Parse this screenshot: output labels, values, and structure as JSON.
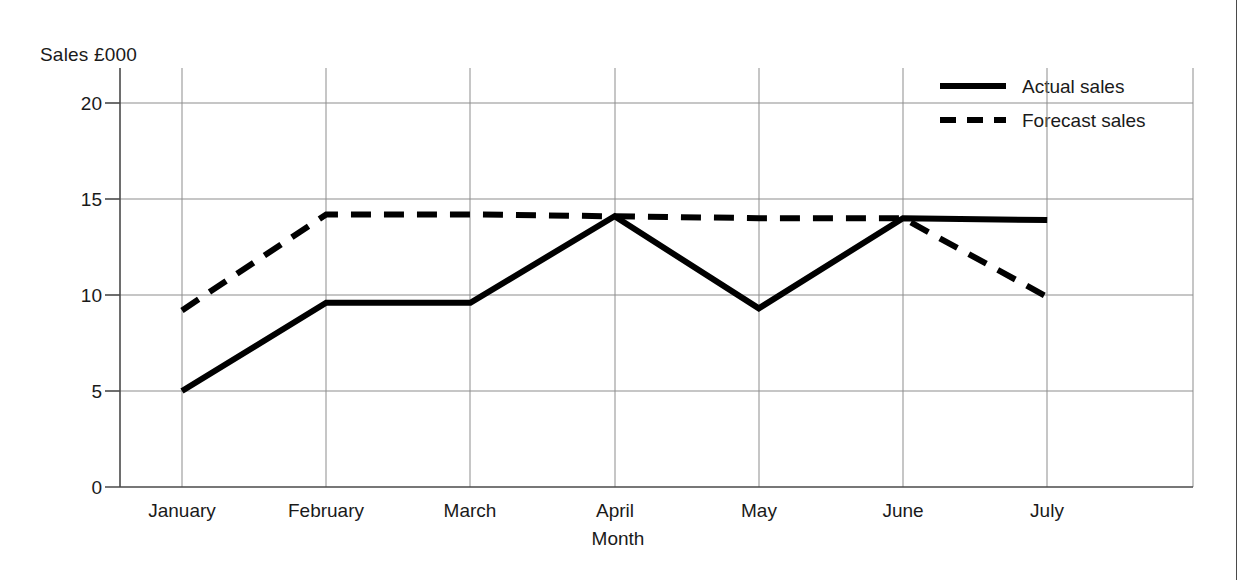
{
  "chart_data": {
    "type": "line",
    "title": "",
    "xlabel": "Month",
    "ylabel": "Sales £000",
    "categories": [
      "January",
      "February",
      "March",
      "April",
      "May",
      "June",
      "July"
    ],
    "series": [
      {
        "name": "Actual sales",
        "style": "solid",
        "color": "#000000",
        "values": [
          5.0,
          9.6,
          9.6,
          14.1,
          9.3,
          14.0,
          13.9
        ]
      },
      {
        "name": "Forecast sales",
        "style": "dashed",
        "color": "#000000",
        "values": [
          9.2,
          14.2,
          14.2,
          14.1,
          14.0,
          14.0,
          9.9
        ]
      }
    ],
    "yticks": [
      0,
      5,
      10,
      15,
      20
    ],
    "ylim": [
      0,
      21.5
    ],
    "grid": true,
    "legend_position": "top-right"
  },
  "axes": {
    "y_title": "Sales £000",
    "x_title": "Month",
    "y_tick_labels": [
      "20",
      "15",
      "10",
      "5",
      "0"
    ],
    "x_tick_labels": [
      "January",
      "February",
      "March",
      "April",
      "May",
      "June",
      "July"
    ]
  },
  "legend": {
    "entries": [
      {
        "label": "Actual sales",
        "style": "solid"
      },
      {
        "label": "Forecast sales",
        "style": "dashed"
      }
    ]
  }
}
